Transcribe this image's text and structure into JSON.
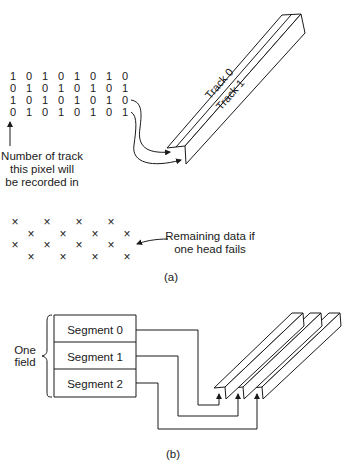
{
  "part_a": {
    "bit_rows": [
      [
        "1",
        "0",
        "1",
        "0",
        "1",
        "0",
        "1",
        "0"
      ],
      [
        "0",
        "1",
        "0",
        "1",
        "0",
        "1",
        "0",
        "1"
      ],
      [
        "1",
        "0",
        "1",
        "0",
        "1",
        "0",
        "1",
        "0"
      ],
      [
        "0",
        "1",
        "0",
        "1",
        "0",
        "1",
        "0",
        "1"
      ]
    ],
    "track_labels": [
      "Track 0",
      "Track 1"
    ],
    "bit_annotation": [
      "Number of track",
      "this pixel will",
      "be recorded in"
    ],
    "x_mark": "×",
    "remaining_annotation": [
      "Remaining data if",
      "one head fails"
    ],
    "caption": "(a)"
  },
  "part_b": {
    "brace_label": [
      "One",
      "field"
    ],
    "segments": [
      "Segment 0",
      "Segment 1",
      "Segment 2"
    ],
    "caption": "(b)"
  }
}
